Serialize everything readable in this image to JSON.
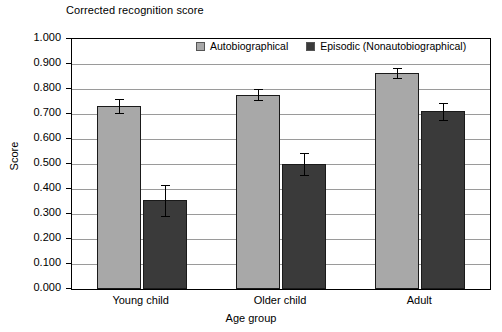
{
  "chart_data": {
    "type": "bar",
    "title": "Corrected recognition score",
    "xlabel": "Age group",
    "ylabel": "Score",
    "categories": [
      "Young child",
      "Older child",
      "Adult"
    ],
    "ylim": [
      0.0,
      1.0
    ],
    "ytick_labels": [
      "0.000",
      "0.100",
      "0.200",
      "0.300",
      "0.400",
      "0.500",
      "0.600",
      "0.700",
      "0.800",
      "0.900",
      "1.000"
    ],
    "ytick_values": [
      0.0,
      0.1,
      0.2,
      0.3,
      0.4,
      0.5,
      0.6,
      0.7,
      0.8,
      0.9,
      1.0
    ],
    "grid": true,
    "legend_position": "top-center-inside",
    "series": [
      {
        "name": "Autobiographical",
        "color": "#a8a8a8",
        "values": [
          0.731,
          0.777,
          0.866
        ],
        "errors": [
          0.028,
          0.022,
          0.02
        ]
      },
      {
        "name": "Episodic (Nonautobiographical)",
        "color": "#3a3a3a",
        "values": [
          0.355,
          0.5,
          0.711
        ],
        "errors": [
          0.062,
          0.045,
          0.033
        ]
      }
    ]
  },
  "legend": {
    "entries": [
      {
        "label": "Autobiographical"
      },
      {
        "label": "Episodic (Nonautobiographical)"
      }
    ]
  }
}
